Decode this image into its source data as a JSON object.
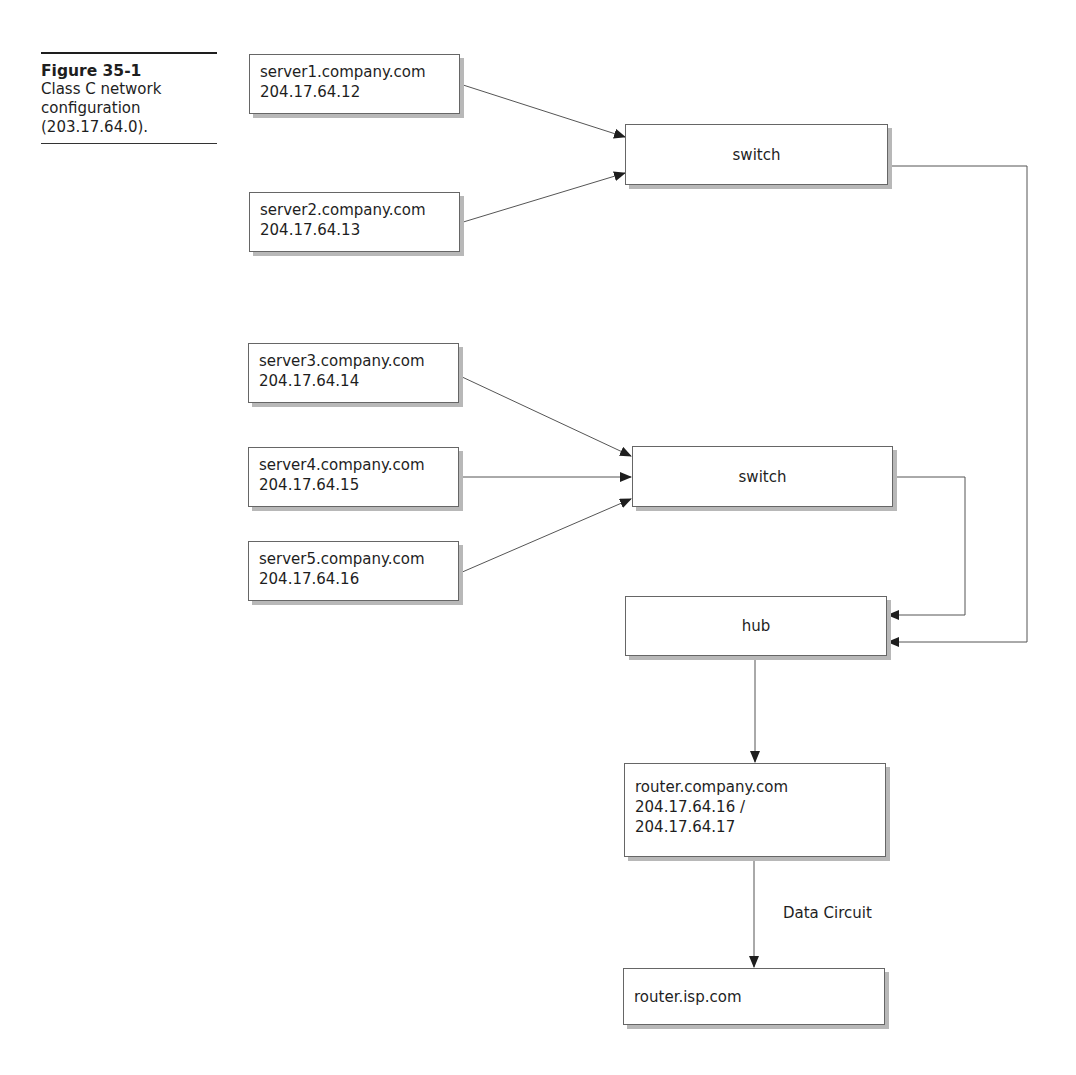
{
  "caption": {
    "title": "Figure 35-1",
    "description_lines": [
      "Class C network",
      "configuration",
      "(203.17.64.0)."
    ]
  },
  "nodes": {
    "server1": {
      "hostname": "server1.company.com",
      "ip": "204.17.64.12"
    },
    "server2": {
      "hostname": "server2.company.com",
      "ip": "204.17.64.13"
    },
    "server3": {
      "hostname": "server3.company.com",
      "ip": "204.17.64.14"
    },
    "server4": {
      "hostname": "server4.company.com",
      "ip": "204.17.64.15"
    },
    "server5": {
      "hostname": "server5.company.com",
      "ip": "204.17.64.16"
    },
    "switch1": {
      "label": "switch"
    },
    "switch2": {
      "label": "switch"
    },
    "hub": {
      "label": "hub"
    },
    "router_company": {
      "hostname": "router.company.com",
      "ip_line1": "204.17.64.16 /",
      "ip_line2": "204.17.64.17"
    },
    "router_isp": {
      "hostname": "router.isp.com"
    }
  },
  "edges": [
    {
      "from": "server1",
      "to": "switch1"
    },
    {
      "from": "server2",
      "to": "switch1"
    },
    {
      "from": "server3",
      "to": "switch2"
    },
    {
      "from": "server4",
      "to": "switch2"
    },
    {
      "from": "server5",
      "to": "switch2"
    },
    {
      "from": "switch2",
      "to": "hub"
    },
    {
      "from": "switch1",
      "to": "hub"
    },
    {
      "from": "hub",
      "to": "router_company"
    },
    {
      "from": "router_company",
      "to": "router_isp",
      "label": "Data Circuit"
    }
  ],
  "edge_labels": {
    "data_circuit": "Data Circuit"
  },
  "colors": {
    "line": "#555555",
    "border": "#666666",
    "shadow": "#b8b8b8",
    "text": "#1e1e1e"
  }
}
